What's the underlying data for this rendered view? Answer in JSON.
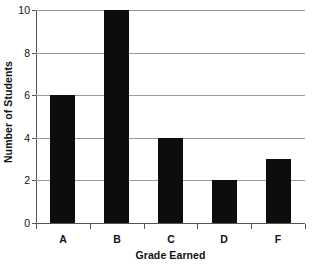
{
  "chart_data": {
    "type": "bar",
    "title": "",
    "categories": [
      "A",
      "B",
      "C",
      "D",
      "F"
    ],
    "values": [
      6,
      10,
      4,
      2,
      3
    ],
    "series": [
      {
        "name": "Number of Students",
        "values": [
          6,
          10,
          4,
          2,
          3
        ]
      }
    ],
    "xlabel": "Grade Earned",
    "ylabel": "Number of Students",
    "ylim": [
      0,
      10
    ],
    "yticks": [
      0,
      2,
      4,
      6,
      8,
      10
    ],
    "ytick_labels": [
      "0",
      "2",
      "4",
      "6",
      "8",
      "10"
    ],
    "grid": true,
    "grid_axis": "y",
    "legend": false,
    "bar_color": "#0d0d0d",
    "grid_color": "#9a9a9a",
    "axis_color": "#555555",
    "background_color": "#ffffff"
  }
}
